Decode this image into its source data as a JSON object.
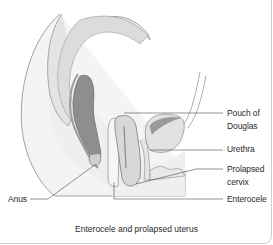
{
  "figure": {
    "caption": "Enterocele and prolapsed uterus",
    "labels": {
      "pouch_of_douglas_line1": "Pouch of",
      "pouch_of_douglas_line2": "Douglas",
      "urethra": "Urethra",
      "prolapsed_cervix_line1": "Prolapsed",
      "prolapsed_cervix_line2": "cervix",
      "enterocele": "Enterocele",
      "anus": "Anus"
    },
    "colors": {
      "outline": "#8a8a8a",
      "tissue_light": "#ececec",
      "tissue_mid": "#d8d8d8",
      "rectum_dark": "#8e8e8e",
      "bladder": "#e2e2e2",
      "leader_line": "#4a4a4a"
    }
  }
}
